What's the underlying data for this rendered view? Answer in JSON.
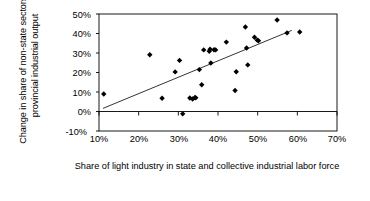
{
  "chart_data": {
    "type": "scatter",
    "title": "",
    "xlabel": "Share of light industry in state and collective industrial labor force",
    "ylabel": "Change in share of non-state sectors in provincial industrial output",
    "xlim": [
      10,
      70
    ],
    "ylim": [
      -10,
      50
    ],
    "xticks": [
      "10%",
      "20%",
      "30%",
      "40%",
      "50%",
      "60%",
      "70%"
    ],
    "xtick_values": [
      10,
      20,
      30,
      40,
      50,
      60,
      70
    ],
    "yticks": [
      "50%",
      "40%",
      "30%",
      "20%",
      "10%",
      "0%",
      "-10%"
    ],
    "ytick_values": [
      50,
      40,
      30,
      20,
      10,
      0,
      -10
    ],
    "grid": false,
    "legend": null,
    "marker": "diamond",
    "marker_color": "#000000",
    "series": [
      {
        "name": "Provinces",
        "points": [
          [
            11.2,
            9.0
          ],
          [
            22.8,
            29.1
          ],
          [
            25.9,
            6.8
          ],
          [
            29.2,
            20.3
          ],
          [
            30.3,
            26.2
          ],
          [
            31.1,
            -1.2
          ],
          [
            32.9,
            6.9
          ],
          [
            33.6,
            6.4
          ],
          [
            34.2,
            7.2
          ],
          [
            34.4,
            7.0
          ],
          [
            35.3,
            21.5
          ],
          [
            35.9,
            13.7
          ],
          [
            36.4,
            31.6
          ],
          [
            37.8,
            30.9
          ],
          [
            38.0,
            31.9
          ],
          [
            38.2,
            24.9
          ],
          [
            39.0,
            31.7
          ],
          [
            39.4,
            31.6
          ],
          [
            42.1,
            35.6
          ],
          [
            44.3,
            10.8
          ],
          [
            44.6,
            20.4
          ],
          [
            46.9,
            43.3
          ],
          [
            47.2,
            32.6
          ],
          [
            47.5,
            23.9
          ],
          [
            49.2,
            38.1
          ],
          [
            49.9,
            36.6
          ],
          [
            50.2,
            36.3
          ],
          [
            54.9,
            46.9
          ],
          [
            57.4,
            40.3
          ],
          [
            60.6,
            40.8
          ]
        ]
      }
    ],
    "trendline": {
      "name": "linear-fit",
      "x_start": 11.0,
      "y_start": 1.6,
      "x_end": 58.6,
      "y_end": 41.6,
      "color": "#000000"
    }
  }
}
